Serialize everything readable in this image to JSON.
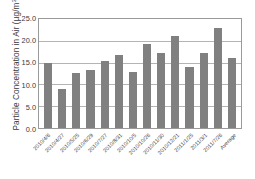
{
  "chart_data": {
    "type": "bar",
    "title": "",
    "xlabel": "",
    "ylabel": "Particle Concentration in Air (µg/m³)",
    "ylabel_text": "Particle Concentration in Air (µg/m",
    "ylabel_sup": "3",
    "ylabel_close": ")",
    "categories": [
      "2010/4/6",
      "2010/4/27",
      "2010/5/25",
      "2010/6/29",
      "2010/7/27",
      "2010/8/31",
      "2010/10/5",
      "2010/10/26",
      "2010/11/30",
      "2010/12/21",
      "2011/1/25",
      "2011/3/1",
      "2011/7/26",
      "Average"
    ],
    "values": [
      14.9,
      9.0,
      12.6,
      13.4,
      15.4,
      16.8,
      12.9,
      19.3,
      17.3,
      21.1,
      14.0,
      17.3,
      22.9,
      16.0
    ],
    "ylim": [
      0.0,
      25.0
    ],
    "yticks": [
      "0.0",
      "5.0",
      "10.0",
      "15.0",
      "20.0",
      "25.0"
    ],
    "ytick_values": [
      0.0,
      5.0,
      10.0,
      15.0,
      20.0,
      25.0
    ],
    "grid": true,
    "legend": false,
    "bar_color": "#808080",
    "grid_color": "#b4b4b4",
    "frame_color": "#9a9a9a",
    "background_color": "#ffffff"
  }
}
